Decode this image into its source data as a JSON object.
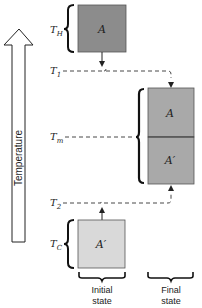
{
  "axis": {
    "label": "Temperature",
    "direction": "up"
  },
  "temperature_levels": {
    "T_H": {
      "base": "T",
      "sub": "H"
    },
    "T_1": {
      "base": "T",
      "sub": "1"
    },
    "T_m": {
      "base": "T",
      "sub": "m"
    },
    "T_2": {
      "base": "T",
      "sub": "2"
    },
    "T_C": {
      "base": "T",
      "sub": "C"
    }
  },
  "blocks": {
    "initial_hot": {
      "label": "A",
      "color": "#8c8c8c"
    },
    "initial_cold": {
      "label": "A′",
      "color": "#d9d9d9"
    },
    "final_top": {
      "label": "A",
      "color": "#a9a9a9"
    },
    "final_bottom": {
      "label": "A′",
      "color": "#a9a9a9"
    }
  },
  "columns": {
    "initial": {
      "line1": "Initial",
      "line2": "state"
    },
    "final": {
      "line1": "Final",
      "line2": "state"
    }
  },
  "colors": {
    "stroke": "#222222",
    "dashed": "#333333"
  }
}
